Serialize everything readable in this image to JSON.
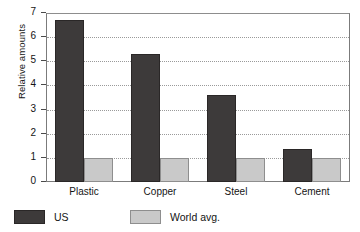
{
  "chart_data": {
    "type": "bar",
    "title": "",
    "xlabel": "",
    "ylabel": "Relative amounts",
    "categories": [
      "Plastic",
      "Copper",
      "Steel",
      "Cement"
    ],
    "series": [
      {
        "name": "US",
        "color": "#3d3a3a",
        "values": [
          6.7,
          5.3,
          3.6,
          1.35
        ]
      },
      {
        "name": "World avg.",
        "color": "#c9c9c9",
        "values": [
          1.0,
          1.0,
          1.0,
          1.0
        ]
      }
    ],
    "ylim": [
      0,
      7
    ],
    "yticks": [
      0,
      1,
      2,
      3,
      4,
      5,
      6,
      7
    ],
    "ytick_labels": [
      "0",
      "1",
      "2",
      "3",
      "4",
      "5",
      "6",
      "7"
    ],
    "grid": "horizontal-dotted",
    "legend_position": "below-left",
    "legend_entries": [
      "US",
      "World avg."
    ],
    "frame_color": "#7b7b7b",
    "gridline_color": "#9a9a9a",
    "background": "#ffffff"
  }
}
